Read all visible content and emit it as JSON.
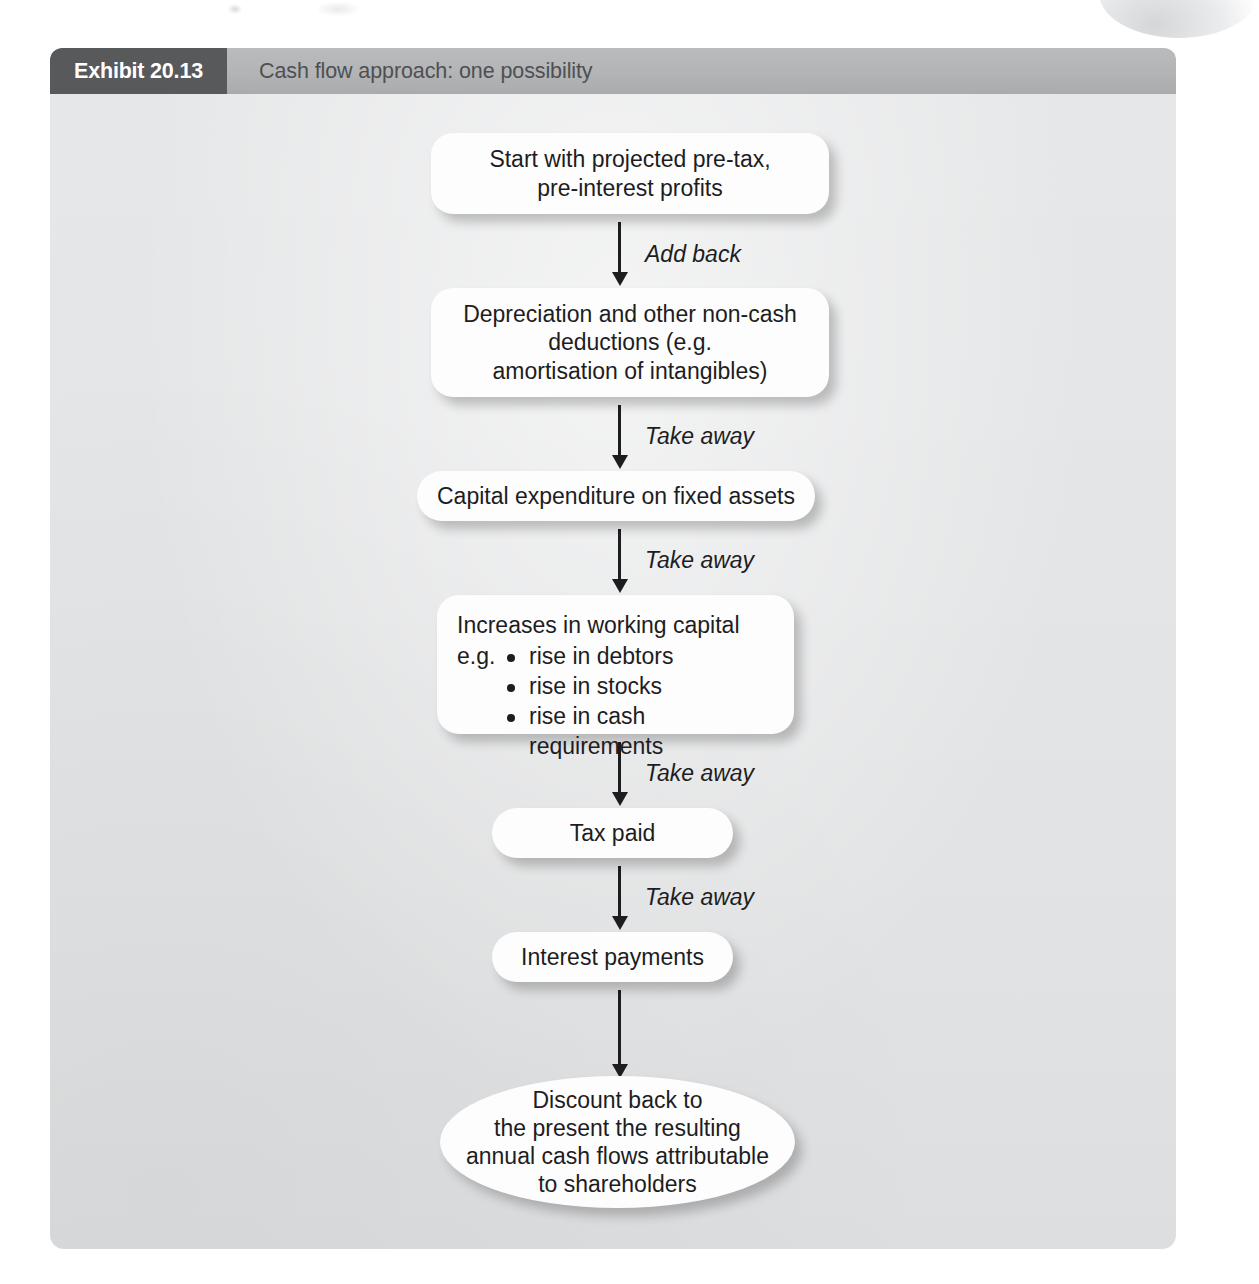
{
  "exhibit": {
    "tag": "Exhibit 20.13",
    "title": "Cash flow approach: one possibility"
  },
  "flow": {
    "nodes": [
      {
        "id": "start-profits",
        "shape": "rounded",
        "lines": [
          "Start with projected pre-tax,",
          "pre-interest profits"
        ]
      },
      {
        "id": "depreciation",
        "shape": "rounded",
        "lines": [
          "Depreciation and other non-cash",
          "deductions (e.g.",
          "amortisation of intangibles)"
        ]
      },
      {
        "id": "capital-expenditure",
        "shape": "pill",
        "lines": [
          "Capital expenditure on fixed assets"
        ]
      },
      {
        "id": "working-capital",
        "shape": "rounded",
        "heading": "Increases in working capital",
        "eg_label": "e.g.",
        "bullets": [
          "rise in debtors",
          "rise in stocks",
          "rise in cash requirements"
        ]
      },
      {
        "id": "tax-paid",
        "shape": "pill",
        "lines": [
          "Tax paid"
        ]
      },
      {
        "id": "interest-payments",
        "shape": "pill",
        "lines": [
          "Interest payments"
        ]
      },
      {
        "id": "discount-back",
        "shape": "ellipse",
        "lines": [
          "Discount back to",
          "the present the resulting",
          "annual cash flows attributable",
          "to shareholders"
        ]
      }
    ],
    "connectors": [
      {
        "id": "c1",
        "label": "Add back"
      },
      {
        "id": "c2",
        "label": "Take away"
      },
      {
        "id": "c3",
        "label": "Take away"
      },
      {
        "id": "c4",
        "label": "Take away"
      },
      {
        "id": "c5",
        "label": "Take away"
      },
      {
        "id": "c6",
        "label": ""
      }
    ]
  },
  "colors": {
    "tag_background": "#58595b",
    "header_background": "#b2b4b6",
    "body_background": "#e4e5e6",
    "node_background": "#fdfdfd",
    "text": "#1d1d1f",
    "title_text": "#4e5052"
  }
}
